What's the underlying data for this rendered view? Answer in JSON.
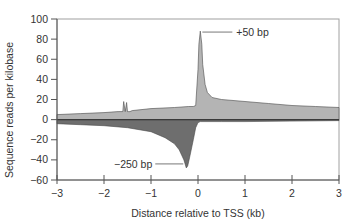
{
  "chart_data": {
    "type": "area",
    "title": "",
    "xlabel": "Distance relative to TSS (kb)",
    "ylabel": "Sequence reads per kilobase",
    "xlim": [
      -3,
      3
    ],
    "ylim": [
      -60,
      100
    ],
    "xticks": [
      -3,
      -2,
      -1,
      0,
      1,
      2,
      3
    ],
    "yticks": [
      100,
      80,
      60,
      40,
      20,
      0,
      -20,
      -40,
      -60
    ],
    "grid": false,
    "legend": null,
    "colors": {
      "sense": "#b4b4b4",
      "antisense": "#6e6e6e",
      "outline": "#4a4a4a",
      "axis": "#555555",
      "frame": "#999999"
    },
    "series": [
      {
        "name": "sense (positive strand)",
        "x": [
          -3.0,
          -2.5,
          -2.0,
          -1.7,
          -1.6,
          -1.58,
          -1.55,
          -1.52,
          -1.5,
          -1.48,
          -1.45,
          -1.4,
          -1.0,
          -0.5,
          -0.2,
          -0.1,
          -0.05,
          0.0,
          0.02,
          0.05,
          0.08,
          0.1,
          0.15,
          0.2,
          0.3,
          0.5,
          1.0,
          1.5,
          2.0,
          2.5,
          3.0
        ],
        "values": [
          5,
          6,
          7,
          8,
          8,
          18,
          8,
          17,
          8,
          8,
          8,
          9,
          11,
          12,
          13,
          13,
          14,
          50,
          75,
          88,
          75,
          55,
          35,
          27,
          22,
          20,
          18,
          16,
          14,
          13,
          12
        ]
      },
      {
        "name": "antisense (negative strand)",
        "x": [
          -3.0,
          -2.5,
          -2.0,
          -1.5,
          -1.0,
          -0.7,
          -0.5,
          -0.4,
          -0.3,
          -0.25,
          -0.22,
          -0.18,
          -0.1,
          -0.05,
          0.0,
          0.05,
          0.5,
          1.0,
          2.0,
          3.0
        ],
        "values": [
          -4,
          -5,
          -6,
          -8,
          -12,
          -18,
          -24,
          -30,
          -40,
          -48,
          -46,
          -38,
          -20,
          -8,
          -3,
          -2,
          -2,
          -2,
          -1.5,
          -1
        ]
      }
    ],
    "annotations": [
      {
        "text": "+50 bp",
        "x": 0.05,
        "y": 88
      },
      {
        "text": "−250 bp",
        "x": -0.25,
        "y": -47
      }
    ]
  }
}
